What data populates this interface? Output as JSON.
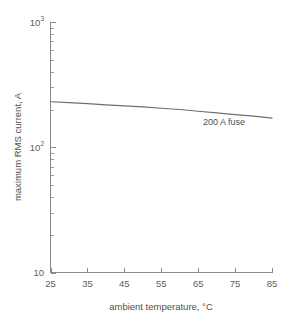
{
  "chart_data": {
    "type": "line",
    "title": "",
    "subtitle": "",
    "xlabel": "ambient temperature, °C",
    "ylabel": "maximum RMS current, A",
    "xlim": [
      25,
      85
    ],
    "ylim": [
      10,
      1000
    ],
    "yscale": "log",
    "xscale": "linear",
    "grid": false,
    "legend_position": "none",
    "xticks": [
      25,
      35,
      45,
      55,
      65,
      75,
      85
    ],
    "xtick_labels": [
      "25",
      "35",
      "45",
      "55",
      "65",
      "75",
      "85"
    ],
    "yticks": [
      10,
      100,
      1000
    ],
    "ytick_labels": [
      "10",
      "10",
      "10"
    ],
    "ytick_mantissa": [
      "10",
      "10",
      "10"
    ],
    "ytick_exponents": [
      "",
      "2",
      "3"
    ],
    "ytick_display": [
      "10",
      "10²",
      "10³"
    ],
    "y_minor_multipliers": [
      2,
      3,
      4,
      5,
      6,
      7,
      8,
      9
    ],
    "annotations": [
      {
        "text": "200 A fuse",
        "x": 72,
        "y": 150
      }
    ],
    "series": [
      {
        "name": "200 A fuse",
        "x": [
          25,
          30,
          35,
          40,
          45,
          50,
          55,
          60,
          65,
          70,
          75,
          80,
          85
        ],
        "values": [
          231,
          227,
          223,
          218,
          214,
          210,
          205,
          200,
          194,
          188,
          182,
          177,
          171
        ]
      }
    ]
  },
  "axis_titles": {
    "x": "ambient temperature, °C",
    "y": "maximum RMS current, A"
  },
  "colors": {
    "background": "#ffffff",
    "axis": "#8a8a8a",
    "curve": "#6e6e6e",
    "text": "#5a5a5a"
  }
}
